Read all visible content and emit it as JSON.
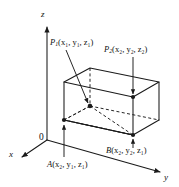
{
  "figure": {
    "background_color": "#ffffff",
    "line_color": "#1a1a1a",
    "axes": {
      "z_label": "z",
      "y_label": "y",
      "x_label": "x",
      "origin_label": "0"
    },
    "points": [
      {
        "name": "P1",
        "label_base": "P",
        "label_sub": "1",
        "coords_text": "(x₁, y₁, z₁)",
        "x_sub": "1",
        "y_sub": "1",
        "z_sub": "1"
      },
      {
        "name": "P2",
        "label_base": "P",
        "label_sub": "2",
        "coords_text": "(x₂, y₂, z₂)",
        "x_sub": "2",
        "y_sub": "2",
        "z_sub": "2"
      },
      {
        "name": "A",
        "label_base": "A",
        "label_sub": "",
        "coords_text": "(x₂, y₁, z₁)",
        "x_sub": "2",
        "y_sub": "1",
        "z_sub": "1"
      },
      {
        "name": "B",
        "label_base": "B",
        "label_sub": "",
        "coords_text": "(x₂, y₂, z₁)",
        "x_sub": "2",
        "y_sub": "2",
        "z_sub": "1"
      }
    ]
  }
}
